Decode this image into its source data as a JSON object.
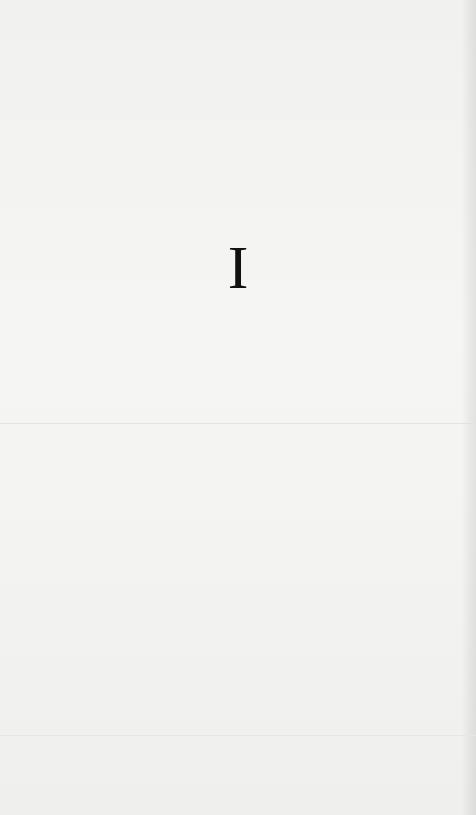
{
  "page": {
    "heading": "I"
  },
  "colors": {
    "paper": "#f3f3f1",
    "ink": "#111111"
  }
}
